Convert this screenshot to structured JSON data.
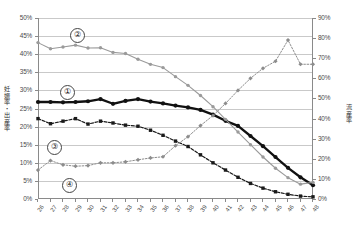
{
  "chart_data": {
    "type": "line",
    "title": "",
    "xlabel": "",
    "ylabel": "妊娠率・出産率",
    "ylabel_right": "流産率",
    "categories": [
      26,
      27,
      28,
      29,
      30,
      31,
      32,
      33,
      34,
      35,
      36,
      37,
      38,
      39,
      40,
      41,
      42,
      43,
      44,
      45,
      46,
      47,
      48
    ],
    "x": [
      "26",
      "27",
      "28",
      "29",
      "30",
      "31",
      "32",
      "33",
      "34",
      "35",
      "36",
      "37",
      "38",
      "39",
      "40",
      "41",
      "42",
      "43",
      "44",
      "45",
      "46",
      "47",
      "48"
    ],
    "xlim": [
      26,
      48
    ],
    "ylim": [
      0,
      50
    ],
    "ylim_right": [
      0,
      90
    ],
    "yticks": [
      "0%",
      "5%",
      "10%",
      "15%",
      "20%",
      "25%",
      "30%",
      "35%",
      "40%",
      "45%",
      "50%"
    ],
    "yticks_right": [
      "0%",
      "10%",
      "20%",
      "30%",
      "40%",
      "50%",
      "60%",
      "70%",
      "80%",
      "90%"
    ],
    "grid": true,
    "legend": "inline-circled-numbers",
    "series": [
      {
        "name": "①",
        "label": "妊娠率(総ETあたり)",
        "axis": "left",
        "color": "#111111",
        "style": "solid-thick",
        "marker": "circle",
        "values": [
          26.8,
          26.8,
          26.7,
          26.8,
          27.0,
          27.6,
          26.3,
          27.1,
          27.6,
          26.9,
          26.4,
          25.8,
          25.3,
          24.6,
          23.3,
          21.6,
          20.2,
          17.4,
          14.6,
          11.6,
          8.6,
          6.0,
          3.8
        ]
      },
      {
        "name": "②",
        "label": "妊娠率(ETあたり)",
        "axis": "left",
        "color": "#9a9a9a",
        "style": "solid",
        "marker": "circle",
        "values": [
          43.2,
          41.5,
          42.0,
          42.5,
          41.7,
          41.8,
          40.5,
          40.2,
          38.6,
          37.2,
          36.3,
          33.8,
          31.4,
          28.6,
          25.5,
          22.0,
          18.5,
          15.0,
          11.6,
          8.5,
          5.9,
          4.1,
          4.6
        ]
      },
      {
        "name": "③",
        "label": "生産率(総ETあたり)",
        "axis": "left",
        "color": "#1a1a1a",
        "style": "dashed",
        "marker": "square",
        "values": [
          22.2,
          20.8,
          21.5,
          22.2,
          20.7,
          21.5,
          21.0,
          20.4,
          20.1,
          19.0,
          17.6,
          16.0,
          14.5,
          12.2,
          10.0,
          8.0,
          6.0,
          4.3,
          3.0,
          2.0,
          1.3,
          0.8,
          0.6
        ]
      },
      {
        "name": "④",
        "label": "流産率",
        "axis": "right",
        "color": "#8c8c8c",
        "style": "dotted",
        "marker": "diamond",
        "values": [
          14.4,
          19.1,
          17.0,
          16.3,
          16.6,
          18.0,
          18.0,
          18.5,
          19.5,
          20.4,
          21.0,
          26.5,
          31.0,
          36.5,
          41.5,
          47.5,
          54.0,
          60.0,
          65.0,
          68.5,
          79.0,
          67.0,
          67.0
        ]
      }
    ],
    "annotations": [
      {
        "id": "callout-1",
        "text": "①"
      },
      {
        "id": "callout-2",
        "text": "②"
      },
      {
        "id": "callout-3",
        "text": "③"
      },
      {
        "id": "callout-4",
        "text": "④"
      }
    ]
  },
  "axes": {
    "left_title": "妊娠率・出産率",
    "right_title": "流産率"
  }
}
